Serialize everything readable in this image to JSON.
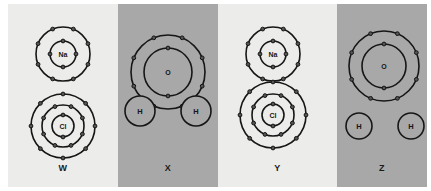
{
  "figure": {
    "background": "#ffffff",
    "panel_light_color": "#ececea",
    "panel_dark_color": "#a8a8a8",
    "line_color": "#161616",
    "electron_color": "#555555"
  },
  "panels": [
    {
      "id": "W",
      "label": "W",
      "shade": "light",
      "description": "Separate sodium atom and chlorine atom, not touching",
      "species": [
        {
          "symbol": "Na",
          "name": "sodium-atom",
          "center_x": 55,
          "center_y": 50,
          "shells": [
            {
              "radius": 13,
              "electrons": 4
            },
            {
              "radius": 27,
              "electrons": 8
            }
          ]
        },
        {
          "symbol": "Cl",
          "name": "chlorine-atom",
          "center_x": 55,
          "center_y": 122,
          "shells": [
            {
              "radius": 11,
              "electrons": 2
            },
            {
              "radius": 21,
              "electrons": 8
            },
            {
              "radius": 32,
              "electrons": 8
            }
          ]
        }
      ]
    },
    {
      "id": "X",
      "label": "X",
      "shade": "dark",
      "description": "Oxygen atom bonded to two hydrogen atoms, overlapping shells (water molecule)",
      "species": [
        {
          "symbol": "O",
          "name": "oxygen-atom",
          "center_x": 50,
          "center_y": 68,
          "shells": [
            {
              "radius": 24,
              "electrons": 2
            },
            {
              "radius": 37,
              "electrons": 8
            }
          ]
        },
        {
          "symbol": "H",
          "name": "hydrogen-atom-left",
          "center_x": 22,
          "center_y": 107,
          "radius": 15
        },
        {
          "symbol": "H",
          "name": "hydrogen-atom-right",
          "center_x": 78,
          "center_y": 107,
          "radius": 15
        }
      ]
    },
    {
      "id": "Y",
      "label": "Y",
      "shade": "light",
      "description": "Sodium atom touching chlorine atom, shells in contact",
      "species": [
        {
          "symbol": "Na",
          "name": "sodium-atom",
          "center_x": 55,
          "center_y": 50,
          "shells": [
            {
              "radius": 13,
              "electrons": 4
            },
            {
              "radius": 27,
              "electrons": 8
            }
          ]
        },
        {
          "symbol": "Cl",
          "name": "chlorine-atom",
          "center_x": 55,
          "center_y": 111,
          "shells": [
            {
              "radius": 11,
              "electrons": 2
            },
            {
              "radius": 21,
              "electrons": 8
            },
            {
              "radius": 33,
              "electrons": 8
            }
          ]
        }
      ]
    },
    {
      "id": "Z",
      "label": "Z",
      "shade": "dark",
      "description": "Separate oxygen atom and two hydrogen atoms, not touching",
      "species": [
        {
          "symbol": "O",
          "name": "oxygen-atom",
          "center_x": 47,
          "center_y": 62,
          "shells": [
            {
              "radius": 22,
              "electrons": 2
            },
            {
              "radius": 35,
              "electrons": 8
            }
          ]
        },
        {
          "symbol": "H",
          "name": "hydrogen-atom-left",
          "center_x": 22,
          "center_y": 122,
          "radius": 13
        },
        {
          "symbol": "H",
          "name": "hydrogen-atom-right",
          "center_x": 74,
          "center_y": 122,
          "radius": 13
        }
      ]
    }
  ]
}
